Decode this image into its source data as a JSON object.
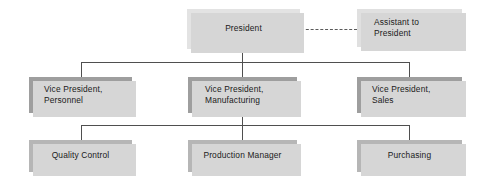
{
  "chart": {
    "type": "org-chart",
    "nodes": [
      {
        "id": "president",
        "label": "President",
        "level": 0,
        "tone": "#e3e3e3"
      },
      {
        "id": "assistant",
        "label": "Assistant to\nPresident",
        "level": 0,
        "tone": "#e0e0e0"
      },
      {
        "id": "vp-personnel",
        "label": "Vice President,\nPersonnel",
        "level": 1,
        "tone": "#9e9e9e"
      },
      {
        "id": "vp-manufacturing",
        "label": "Vice President,\nManufacturing",
        "level": 1,
        "tone": "#9e9e9e"
      },
      {
        "id": "vp-sales",
        "label": "Vice President,\nSales",
        "level": 1,
        "tone": "#9e9e9e"
      },
      {
        "id": "quality-control",
        "label": "Quality Control",
        "level": 2,
        "tone": "#b6b6b6"
      },
      {
        "id": "production-manager",
        "label": "Production Manager",
        "level": 2,
        "tone": "#b6b6b6"
      },
      {
        "id": "purchasing",
        "label": "Purchasing",
        "level": 2,
        "tone": "#b6b6b6"
      }
    ],
    "edges": [
      {
        "from": "president",
        "to": "assistant",
        "style": "dashed"
      },
      {
        "from": "president",
        "to": "vp-personnel",
        "style": "solid"
      },
      {
        "from": "president",
        "to": "vp-manufacturing",
        "style": "solid"
      },
      {
        "from": "president",
        "to": "vp-sales",
        "style": "solid"
      },
      {
        "from": "vp-manufacturing",
        "to": "quality-control",
        "style": "solid"
      },
      {
        "from": "vp-manufacturing",
        "to": "production-manager",
        "style": "solid"
      },
      {
        "from": "vp-manufacturing",
        "to": "purchasing",
        "style": "solid"
      }
    ],
    "colors": {
      "background": "#ffffff",
      "line": "#4f4f4f",
      "shadow": "#d6d6d6",
      "text": "#1a1a1a"
    }
  }
}
